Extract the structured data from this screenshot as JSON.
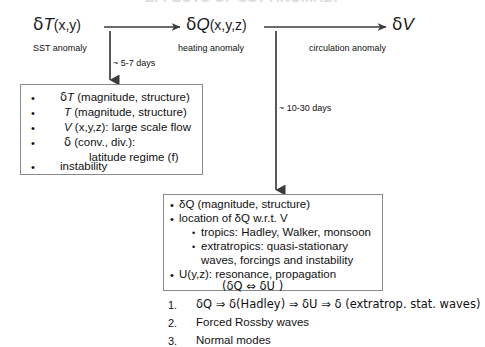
{
  "title": "EFFECTS OF SST ANOMALY",
  "flow": {
    "nodes": [
      {
        "symbol_delta": "δ",
        "symbol_var": "T",
        "symbol_args": "(x,y)",
        "caption": "SST anomaly"
      },
      {
        "symbol_delta": "δ",
        "symbol_var": "Q",
        "symbol_args": "(x,y,z)",
        "caption": "heating anomaly"
      },
      {
        "symbol_delta": "δ",
        "symbol_var": "V",
        "symbol_args": "",
        "caption": "circulation anomaly"
      }
    ],
    "timings": [
      "~ 5-7 days",
      "~ 10-30 days"
    ]
  },
  "left_box": {
    "bullet_glyph": "•",
    "items": [
      {
        "delta": "δ",
        "var": "T",
        "rest": " (magnitude, structure)",
        "bulleted": true,
        "indent": 40
      },
      {
        "delta": "",
        "var": "T",
        "rest": " (magnitude, structure)",
        "bulleted": true,
        "indent": 44
      },
      {
        "delta": "",
        "var": "V",
        "rest": " (x,y,z): large scale flow",
        "bulleted": true,
        "indent": 44
      },
      {
        "delta": "δ",
        "var": "",
        "rest": " (conv., div.):",
        "bulleted": true,
        "indent": 44
      },
      {
        "delta": "",
        "var": "",
        "rest": "latitude regime (f)",
        "bulleted": false,
        "indent": 70,
        "italic_tail": "f"
      },
      {
        "delta": "",
        "var": "",
        "rest": "instability",
        "bulleted": true,
        "indent": 40
      }
    ]
  },
  "right_box": {
    "bullet_glyph": "•",
    "subbullet_glyph": "•",
    "items": [
      {
        "text": "δQ (magnitude, structure)",
        "level": 1
      },
      {
        "text": "location of δQ  w.r.t.  V",
        "level": 1
      },
      {
        "text": "tropics: Hadley, Walker, monsoon",
        "level": 2
      },
      {
        "text": "extratropics: quasi-stationary",
        "level": 2
      },
      {
        "text": "waves, forcings and instability",
        "level": 3
      },
      {
        "text": "U(y,z): resonance, propagation",
        "level": 1
      },
      {
        "text": "(δQ ⇔ δU )",
        "level": 4
      }
    ]
  },
  "numbered_list": {
    "items": [
      {
        "number": "1.",
        "text": "δQ ⇒ δ(Hadley) ⇒ δU ⇒ δ (extratrop. stat. waves)"
      },
      {
        "number": "2.",
        "text": "Forced Rossby waves"
      },
      {
        "number": "3.",
        "text": "Normal modes"
      }
    ]
  },
  "colors": {
    "background": "#ffffff",
    "text": "#111111",
    "arrow": "#3b3b3b",
    "box_border": "#8a8a8a",
    "title_faded": "#dcdce2"
  }
}
